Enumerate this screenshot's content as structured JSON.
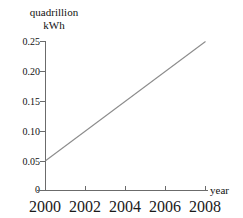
{
  "chart_data": {
    "type": "line",
    "title": "",
    "xlabel": "year",
    "ylabel": "quadrillion kWh",
    "ylabel_line1": "quadrillion",
    "ylabel_line2": "kWh",
    "x": [
      2000,
      2008
    ],
    "values": [
      0.05,
      0.25
    ],
    "series": [
      {
        "name": "",
        "x": [
          2000,
          2008
        ],
        "values": [
          0.05,
          0.25
        ]
      }
    ],
    "xlim": [
      2000,
      2008
    ],
    "ylim": [
      0,
      0.25
    ],
    "xticks": [
      2000,
      2002,
      2004,
      2006,
      2008
    ],
    "xtick_labels": [
      "2000",
      "2002",
      "2004",
      "2006",
      "2008"
    ],
    "yticks": [
      0,
      0.05,
      0.1,
      0.15,
      0.2,
      0.25
    ],
    "ytick_labels": [
      "0",
      "0.05",
      "0.10",
      "0.15",
      "0.20",
      "0.25"
    ],
    "grid": false,
    "legend": null,
    "line_color": "#8c8c8c",
    "axis_color": "#6b6b6b"
  }
}
